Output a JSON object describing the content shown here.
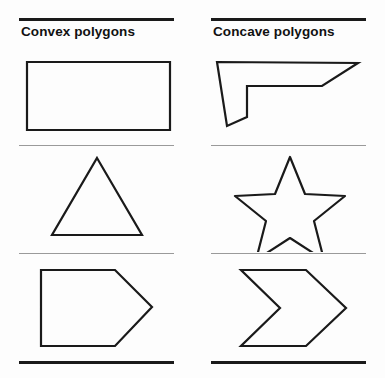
{
  "figure": {
    "background_color": "#fdfdfd",
    "line_color": "#1a1a1a",
    "divider_color": "#9a9a9a"
  },
  "columns": [
    {
      "id": "convex",
      "title": "Convex polygons",
      "shapes": [
        {
          "name": "rectangle",
          "label": "rectangle",
          "points": "8,14 151,14 151,82 8,82",
          "closed": true,
          "corner_style": "miter"
        },
        {
          "name": "triangle",
          "label": "triangle",
          "points": "78,11 123,88 33,88",
          "closed": true,
          "corner_style": "miter"
        },
        {
          "name": "pentagon",
          "label": "pentagon",
          "points": "22,15 96,15 133,52 96,91 22,91",
          "closed": true,
          "corner_style": "miter"
        }
      ]
    },
    {
      "id": "concave",
      "title": "Concave polygons",
      "shapes": [
        {
          "name": "bent-arrow",
          "label": "bent arrow",
          "points": "6,14 147,15 111,38 36,38 36,69 16,78",
          "closed": true,
          "corner_style": "miter"
        },
        {
          "name": "star",
          "label": "five-pointed star",
          "points": "79,10 94,47 134,49 103,74 113,113 79,91 45,113 55,74 24,49 64,47",
          "closed": true,
          "corner_style": "round"
        },
        {
          "name": "chevron",
          "label": "chevron",
          "points": "30,15 95,15 135,53 95,91 30,91 69,53",
          "closed": true,
          "corner_style": "miter"
        }
      ]
    }
  ]
}
